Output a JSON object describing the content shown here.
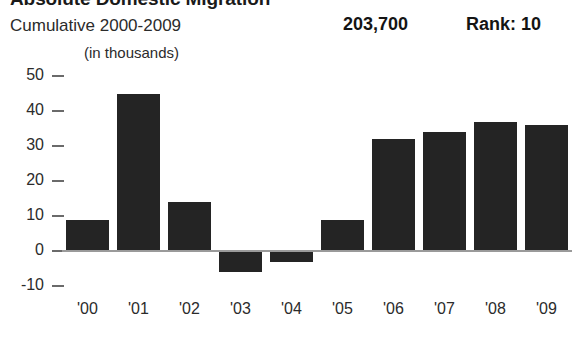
{
  "header": {
    "title": "Absolute Domestic Migration",
    "subtitle": "Cumulative 2000-2009",
    "total_value": "203,700",
    "rank_label": "Rank: 10",
    "units_note": "(in thousands)"
  },
  "chart_data": {
    "type": "bar",
    "title": "Absolute Domestic Migration",
    "subtitle": "Cumulative 2000-2009",
    "xlabel": "",
    "ylabel": "",
    "units": "(in thousands)",
    "categories": [
      "'00",
      "'01",
      "'02",
      "'03",
      "'04",
      "'05",
      "'06",
      "'07",
      "'08",
      "'09"
    ],
    "values": [
      9,
      45,
      14,
      -6,
      -3,
      9,
      32,
      34,
      37,
      36
    ],
    "ylim": [
      -10,
      50
    ],
    "yticks": [
      50,
      40,
      30,
      20,
      10,
      0,
      -10
    ],
    "ytick_labels": [
      "50",
      "40",
      "30",
      "20",
      "10",
      "0",
      "-10"
    ],
    "grid": false,
    "legend": "none",
    "bar_color": "#242424",
    "zero_line_color": "#9a9a9a",
    "cumulative_total": "203,700",
    "rank": "Rank: 10"
  }
}
